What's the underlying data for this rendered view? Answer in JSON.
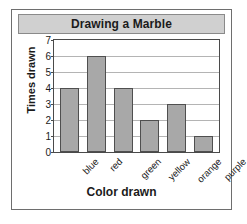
{
  "chart_data": {
    "type": "bar",
    "title": "Drawing a Marble",
    "xlabel": "Color drawn",
    "ylabel": "Times drawn",
    "categories": [
      "blue",
      "red",
      "green",
      "yellow",
      "orange",
      "purple"
    ],
    "values": [
      4,
      6,
      4,
      2,
      3,
      1
    ],
    "ylim": [
      0,
      7
    ],
    "yticks": [
      0,
      1,
      2,
      3,
      4,
      5,
      6,
      7
    ],
    "ytick_labels": [
      "0",
      "1",
      "2",
      "3",
      "4",
      "5",
      "6",
      "7"
    ],
    "grid": true,
    "legend": false,
    "bar_color": "#a8a8a8",
    "bar_edge_color": "#4f4f4f",
    "title_band_color": "#d0d0d0",
    "plot_background": "#ffffff",
    "gridline_color": "#b4b4b4"
  }
}
